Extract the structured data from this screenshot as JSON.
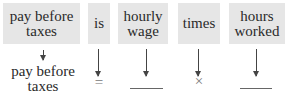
{
  "boxes": [
    {
      "id": "pay-before-taxes",
      "label": "pay before taxes"
    },
    {
      "id": "is",
      "label": "is"
    },
    {
      "id": "hourly-wage",
      "label": "hourly wage"
    },
    {
      "id": "times",
      "label": "times"
    },
    {
      "id": "hours-worked",
      "label": "hours worked"
    }
  ],
  "translations": {
    "pay_before_taxes": "pay before taxes",
    "is": "=",
    "hourly_wage": "",
    "times": "×",
    "hours_worked": ""
  },
  "colors": {
    "box_fill": "#e6e6e6",
    "text": "#2a2a2a",
    "arrow": "#444444"
  }
}
